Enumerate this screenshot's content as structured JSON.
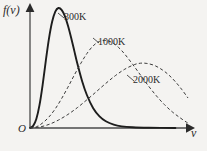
{
  "figure": {
    "background_color": "#f4f3f1",
    "ink_color": "#2b2b2b"
  },
  "axes": {
    "y_label": "f(v)",
    "x_label": "v",
    "origin_label": "O",
    "x_axis_y_px": 128,
    "y_axis_x_px": 30,
    "x_axis_end_px": 188,
    "y_axis_top_px": 8,
    "arrowheads": true,
    "ticks": false,
    "grid": false
  },
  "labels": {
    "curve_300": "300K",
    "curve_1000": "1000K",
    "curve_2000": "2000K"
  },
  "chart_data": {
    "type": "line",
    "xlabel": "v",
    "ylabel": "f(v)",
    "xlim": [
      0,
      1
    ],
    "ylim": [
      0,
      1
    ],
    "grid": false,
    "legend": "inline-annotations",
    "tick_labels": {
      "x": [],
      "y": []
    },
    "series": [
      {
        "name": "300K",
        "label": "300K",
        "style": "solid",
        "color": "#1d1d1d",
        "width": 1.9,
        "peak": {
          "x": 0.18,
          "y": 1.0
        },
        "tail_end_x": 0.92,
        "points": [
          [
            0.0,
            0.0
          ],
          [
            0.02,
            0.018
          ],
          [
            0.04,
            0.075
          ],
          [
            0.06,
            0.19
          ],
          [
            0.08,
            0.36
          ],
          [
            0.1,
            0.56
          ],
          [
            0.12,
            0.745
          ],
          [
            0.14,
            0.885
          ],
          [
            0.16,
            0.97
          ],
          [
            0.18,
            1.0
          ],
          [
            0.2,
            0.985
          ],
          [
            0.22,
            0.935
          ],
          [
            0.24,
            0.855
          ],
          [
            0.26,
            0.755
          ],
          [
            0.28,
            0.645
          ],
          [
            0.3,
            0.535
          ],
          [
            0.33,
            0.39
          ],
          [
            0.36,
            0.275
          ],
          [
            0.4,
            0.165
          ],
          [
            0.44,
            0.097
          ],
          [
            0.48,
            0.056
          ],
          [
            0.53,
            0.028
          ],
          [
            0.58,
            0.014
          ],
          [
            0.65,
            0.006
          ],
          [
            0.75,
            0.002
          ],
          [
            0.92,
            0.0
          ]
        ]
      },
      {
        "name": "1000K",
        "label": "1000K",
        "style": "dashed",
        "color": "#3a3a3a",
        "width": 1.0,
        "peak": {
          "x": 0.48,
          "y": 0.73
        },
        "tail_end_x": 1.0,
        "points": [
          [
            0.0,
            0.0
          ],
          [
            0.04,
            0.01
          ],
          [
            0.08,
            0.042
          ],
          [
            0.12,
            0.092
          ],
          [
            0.16,
            0.16
          ],
          [
            0.2,
            0.245
          ],
          [
            0.24,
            0.34
          ],
          [
            0.28,
            0.44
          ],
          [
            0.32,
            0.535
          ],
          [
            0.36,
            0.62
          ],
          [
            0.4,
            0.685
          ],
          [
            0.44,
            0.722
          ],
          [
            0.48,
            0.73
          ],
          [
            0.52,
            0.712
          ],
          [
            0.56,
            0.672
          ],
          [
            0.6,
            0.615
          ],
          [
            0.65,
            0.53
          ],
          [
            0.7,
            0.44
          ],
          [
            0.75,
            0.35
          ],
          [
            0.8,
            0.268
          ],
          [
            0.85,
            0.196
          ],
          [
            0.9,
            0.135
          ],
          [
            0.95,
            0.085
          ],
          [
            1.0,
            0.04
          ]
        ]
      },
      {
        "name": "2000K",
        "label": "2000K",
        "style": "dashed",
        "color": "#3a3a3a",
        "width": 1.0,
        "peak": {
          "x": 0.67,
          "y": 0.54
        },
        "tail_end_x": 1.0,
        "points": [
          [
            0.0,
            0.0
          ],
          [
            0.06,
            0.008
          ],
          [
            0.12,
            0.03
          ],
          [
            0.18,
            0.066
          ],
          [
            0.24,
            0.113
          ],
          [
            0.3,
            0.17
          ],
          [
            0.36,
            0.235
          ],
          [
            0.42,
            0.303
          ],
          [
            0.48,
            0.372
          ],
          [
            0.54,
            0.436
          ],
          [
            0.6,
            0.49
          ],
          [
            0.66,
            0.528
          ],
          [
            0.7,
            0.54
          ],
          [
            0.74,
            0.538
          ],
          [
            0.79,
            0.52
          ],
          [
            0.84,
            0.482
          ],
          [
            0.88,
            0.44
          ],
          [
            0.92,
            0.386
          ],
          [
            0.96,
            0.322
          ],
          [
            1.0,
            0.25
          ]
        ]
      }
    ]
  }
}
